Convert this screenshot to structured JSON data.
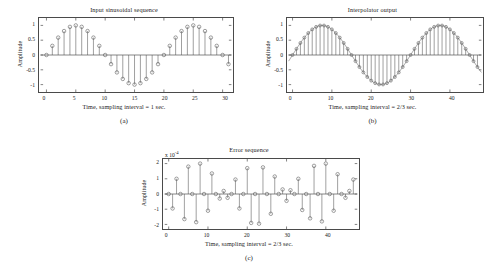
{
  "figure": {
    "panels": [
      {
        "id": "a",
        "title": "Input sinusoidal sequence",
        "xlabel": "Time, sampling interval = 1 sec.",
        "ylabel": "Amplitude",
        "sublabel": "(a)",
        "exponent": ""
      },
      {
        "id": "b",
        "title": "Interpolator output",
        "xlabel": "Time, sampling interval = 2/3 sec.",
        "ylabel": "Amplitude",
        "sublabel": "(b)",
        "exponent": ""
      },
      {
        "id": "c",
        "title": "Error sequence",
        "xlabel": "Time, sampling interval = 2/3 sec.",
        "ylabel": "Amplitude",
        "sublabel": "(c)",
        "exponent": "x 10",
        "exponent_sup": "-4"
      }
    ]
  },
  "chart_data": [
    {
      "type": "line",
      "subplot": "a",
      "title": "Input sinusoidal sequence",
      "xlabel": "Time, sampling interval = 1 sec.",
      "ylabel": "Amplitude",
      "xlim": [
        -1,
        31.5
      ],
      "ylim": [
        -1.25,
        1.25
      ],
      "xticks": [
        0,
        5,
        10,
        15,
        20,
        25,
        30
      ],
      "yticks": [
        -1,
        -0.5,
        0,
        0.5,
        1
      ],
      "grid": false,
      "legend": null,
      "marker": "circle",
      "stem": true,
      "x": [
        0,
        1,
        2,
        3,
        4,
        5,
        6,
        7,
        8,
        9,
        10,
        11,
        12,
        13,
        14,
        15,
        16,
        17,
        18,
        19,
        20,
        21,
        22,
        23,
        24,
        25,
        26,
        27,
        28,
        29,
        30,
        31
      ],
      "values": [
        0,
        0.309,
        0.588,
        0.809,
        0.951,
        1,
        0.951,
        0.809,
        0.588,
        0.309,
        0,
        -0.309,
        -0.588,
        -0.809,
        -0.951,
        -1,
        -0.951,
        -0.809,
        -0.588,
        -0.309,
        0,
        0.309,
        0.588,
        0.809,
        0.951,
        1,
        0.951,
        0.809,
        0.588,
        0.309,
        0,
        -0.309
      ]
    },
    {
      "type": "line",
      "subplot": "b",
      "title": "Interpolator output",
      "xlabel": "Time, sampling interval = 2/3 sec.",
      "ylabel": "Amplitude",
      "xlim": [
        -1,
        48
      ],
      "ylim": [
        -1.25,
        1.25
      ],
      "xticks": [
        0,
        10,
        20,
        30,
        40
      ],
      "yticks": [
        -1,
        -0.5,
        0,
        0.5,
        1
      ],
      "grid": false,
      "legend": null,
      "marker": "circle",
      "stem": true,
      "x": [
        0,
        1,
        2,
        3,
        4,
        5,
        6,
        7,
        8,
        9,
        10,
        11,
        12,
        13,
        14,
        15,
        16,
        17,
        18,
        19,
        20,
        21,
        22,
        23,
        24,
        25,
        26,
        27,
        28,
        29,
        30,
        31,
        32,
        33,
        34,
        35,
        36,
        37,
        38,
        39,
        40,
        41,
        42,
        43,
        44,
        45,
        46,
        47
      ],
      "values": [
        0,
        0.208,
        0.407,
        0.588,
        0.743,
        0.866,
        0.951,
        0.995,
        0.995,
        0.951,
        0.866,
        0.743,
        0.588,
        0.407,
        0.208,
        0,
        -0.208,
        -0.407,
        -0.588,
        -0.743,
        -0.866,
        -0.951,
        -0.995,
        -0.995,
        -0.951,
        -0.866,
        -0.743,
        -0.588,
        -0.407,
        -0.208,
        0,
        0.208,
        0.407,
        0.588,
        0.743,
        0.866,
        0.951,
        0.995,
        0.995,
        0.951,
        0.866,
        0.743,
        0.588,
        0.407,
        0.208,
        0,
        -0.208,
        -0.407
      ]
    },
    {
      "type": "line",
      "subplot": "c",
      "title": "Error sequence",
      "xlabel": "Time, sampling interval = 2/3 sec.",
      "ylabel": "Amplitude",
      "exponent_text": "x 10",
      "exponent_power": "-4",
      "xlim": [
        -1,
        48
      ],
      "ylim": [
        -2.3,
        2.3
      ],
      "xticks": [
        0,
        10,
        20,
        30,
        40
      ],
      "yticks": [
        -2,
        -1,
        0,
        1,
        2
      ],
      "grid": false,
      "legend": null,
      "marker": "circle",
      "stem": true,
      "x": [
        0,
        1,
        2,
        3,
        4,
        5,
        6,
        7,
        8,
        9,
        10,
        11,
        12,
        13,
        14,
        15,
        16,
        17,
        18,
        19,
        20,
        21,
        22,
        23,
        24,
        25,
        26,
        27,
        28,
        29,
        30,
        31,
        32,
        33,
        34,
        35,
        36,
        37,
        38,
        39,
        40,
        41,
        42,
        43,
        44,
        45,
        46,
        47
      ],
      "values": [
        0,
        -0.95,
        1.0,
        0,
        -1.65,
        1.8,
        0,
        -1.85,
        2.0,
        0,
        -1.1,
        1.35,
        0,
        -0.3,
        0.2,
        -0.25,
        0,
        0.95,
        -0.95,
        0,
        1.7,
        -1.9,
        0,
        -1.95,
        1.75,
        0,
        -1.3,
        1.15,
        0,
        0.3,
        -0.45,
        0.25,
        0,
        1.0,
        -1.05,
        0,
        -1.6,
        1.85,
        0,
        -1.8,
        2.0,
        0,
        -1.1,
        1.3,
        0,
        -0.25,
        0.2,
        0.95
      ]
    }
  ]
}
